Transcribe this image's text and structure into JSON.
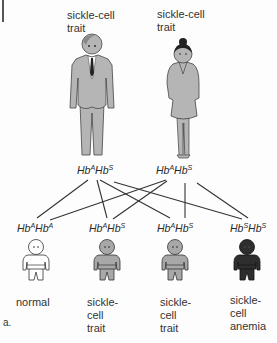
{
  "figure_letter": "a.",
  "parents": [
    {
      "id": "father",
      "label_line1": "sickle-cell",
      "label_line2": "trait",
      "genotype": {
        "base1": "Hb",
        "sup1": "A",
        "base2": "Hb",
        "sup2": "S"
      }
    },
    {
      "id": "mother",
      "label_line1": "sickle-cell",
      "label_line2": "trait",
      "genotype": {
        "base1": "Hb",
        "sup1": "A",
        "base2": "Hb",
        "sup2": "S"
      }
    }
  ],
  "children": [
    {
      "genotype": {
        "base1": "Hb",
        "sup1": "A",
        "base2": "Hb",
        "sup2": "A"
      },
      "label_lines": [
        "normal"
      ],
      "fill": "#ffffff"
    },
    {
      "genotype": {
        "base1": "Hb",
        "sup1": "A",
        "base2": "Hb",
        "sup2": "S"
      },
      "label_lines": [
        "sickle-",
        "cell",
        "trait"
      ],
      "fill": "#a8a8a8"
    },
    {
      "genotype": {
        "base1": "Hb",
        "sup1": "A",
        "base2": "Hb",
        "sup2": "S"
      },
      "label_lines": [
        "sickle-",
        "cell",
        "trait"
      ],
      "fill": "#a8a8a8"
    },
    {
      "genotype": {
        "base1": "Hb",
        "sup1": "S",
        "base2": "Hb",
        "sup2": "S"
      },
      "label_lines": [
        "sickle-",
        "cell",
        "anemia"
      ],
      "fill": "#2e2e2e"
    }
  ],
  "colors": {
    "adult_fill": "#b5b5b5",
    "outline": "#333333",
    "line": "#333333"
  }
}
